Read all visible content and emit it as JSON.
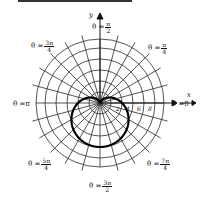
{
  "figure": {
    "type": "polar_graph",
    "axes": {
      "x_label": "x",
      "y_label": "y"
    },
    "angle_labels": [
      {
        "id": "theta-0",
        "prefix": "θ = ",
        "value": "0",
        "fraction": null
      },
      {
        "id": "theta-pi-4",
        "prefix": "θ = ",
        "fraction": {
          "num": "π",
          "den": "4"
        }
      },
      {
        "id": "theta-pi-2",
        "prefix": "θ = ",
        "fraction": {
          "num": "π",
          "den": "2"
        }
      },
      {
        "id": "theta-3pi-4",
        "prefix": "θ = ",
        "fraction": {
          "num": "3π",
          "den": "4"
        }
      },
      {
        "id": "theta-pi",
        "prefix": "θ = ",
        "value": "π",
        "fraction": null
      },
      {
        "id": "theta-5pi-4",
        "prefix": "θ = ",
        "fraction": {
          "num": "5π",
          "den": "4"
        }
      },
      {
        "id": "theta-3pi-2",
        "prefix": "θ = ",
        "fraction": {
          "num": "3π",
          "den": "2"
        }
      },
      {
        "id": "theta-7pi-4",
        "prefix": "θ = ",
        "fraction": {
          "num": "7π",
          "den": "4"
        }
      }
    ],
    "radial_ticks": [
      "2",
      "4",
      "6",
      "8"
    ],
    "grid": {
      "circles": 6,
      "spokes": 24,
      "spoke_step_deg": 15
    },
    "curve": {
      "equation": "r = 4(1 − sin θ)",
      "shape": "cardioid",
      "cusp": "origin",
      "opens": "downward"
    },
    "colors": {
      "ink": "#111111",
      "grid": "#2a2a2a",
      "curve": "#000000",
      "background": "#ffffff"
    }
  }
}
